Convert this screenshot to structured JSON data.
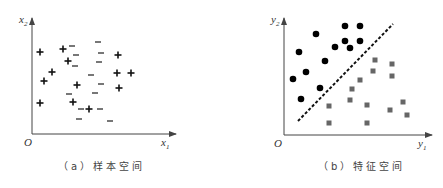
{
  "panels": [
    {
      "id": "a",
      "caption": "（a）样本空间",
      "origin_label": "O",
      "x_axis_label": "x",
      "x_axis_sub": "1",
      "y_axis_label": "x",
      "y_axis_sub": "2",
      "marker_types": [
        "plus",
        "minus"
      ],
      "plus_points": [
        [
          40,
          52
        ],
        [
          63,
          49
        ],
        [
          68,
          61
        ],
        [
          52,
          72
        ],
        [
          44,
          81
        ],
        [
          77,
          85
        ],
        [
          40,
          103
        ],
        [
          73,
          102
        ],
        [
          89,
          109
        ],
        [
          118,
          55
        ],
        [
          117,
          73
        ],
        [
          131,
          73
        ],
        [
          119,
          88
        ]
      ],
      "minus_points": [
        [
          72,
          46
        ],
        [
          98,
          42
        ],
        [
          76,
          55
        ],
        [
          101,
          53
        ],
        [
          75,
          66
        ],
        [
          99,
          62
        ],
        [
          91,
          75
        ],
        [
          101,
          84
        ],
        [
          69,
          94
        ],
        [
          95,
          93
        ],
        [
          81,
          109
        ],
        [
          100,
          109
        ],
        [
          79,
          119
        ],
        [
          110,
          121
        ]
      ]
    },
    {
      "id": "b",
      "caption": "（b）特征空间",
      "origin_label": "O",
      "x_axis_label": "y",
      "x_axis_sub": "1",
      "y_axis_label": "y",
      "y_axis_sub": "2",
      "marker_types": [
        "circle",
        "square"
      ],
      "circle_points": [
        [
          345,
          26
        ],
        [
          360,
          26
        ],
        [
          316,
          34
        ],
        [
          345,
          41
        ],
        [
          360,
          41
        ],
        [
          335,
          47
        ],
        [
          350,
          48
        ],
        [
          299,
          52
        ],
        [
          325,
          61
        ],
        [
          306,
          72
        ],
        [
          293,
          79
        ],
        [
          320,
          88
        ],
        [
          301,
          99
        ]
      ],
      "square_points": [
        [
          375,
          60
        ],
        [
          392,
          64
        ],
        [
          373,
          71
        ],
        [
          392,
          76
        ],
        [
          360,
          80
        ],
        [
          352,
          89
        ],
        [
          350,
          100
        ],
        [
          367,
          105
        ],
        [
          329,
          106
        ],
        [
          390,
          110
        ],
        [
          403,
          102
        ],
        [
          407,
          115
        ],
        [
          329,
          123
        ],
        [
          367,
          123
        ]
      ],
      "separator_line": {
        "x1": 298,
        "y1": 121,
        "x2": 393,
        "y2": 24,
        "style": "dashed"
      }
    }
  ],
  "colors": {
    "axis": "#444444",
    "plus": "#111111",
    "minus": "#555555",
    "circle": "#000000",
    "square": "#666666"
  }
}
